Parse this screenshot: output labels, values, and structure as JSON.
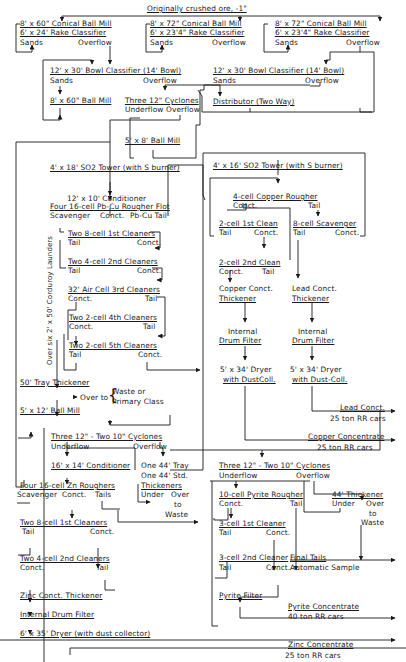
{
  "diagram": {
    "type": "process-flowsheet",
    "feed": "Originally crushed ore, -1\"",
    "nodes": {
      "mill_a": "8' x 60\" Conical Ball Mill",
      "class_a": "6' x 24' Rake Classifier",
      "mill_b": "8' x 72\" Conical Ball Mill",
      "class_b": "6' x 23'4\" Rake Classifier",
      "mill_c": "8' x 72\" Conical Ball Mill",
      "class_c": "6' x 23'4\" Rake Classifier",
      "bowl_1": "12' x 30' Bowl Classifier (14' Bowl)",
      "bowl_2": "12' x 30' Bowl Classifier (14' Bowl)",
      "ball_mill_60": "8' x 60\" Ball Mill",
      "cyclones_3": "Three 12\" Cyclones",
      "distributor": "Distributor (Two Way)",
      "ball_mill_5x8": "5' x 8' Ball Mill",
      "so2_tower_18": "4' x 18' SO2 Tower (with S burner)",
      "conditioner_12": "12' x 10' Conditioner",
      "pbcu_rougher": "Four 16-cell Pb-Cu Rougher Flot",
      "clean1": "Two 8-cell 1st Cleaners",
      "clean2": "Two 4-cell 2nd Cleaners",
      "clean3": "32' Air Cell 3rd Cleaners",
      "clean4": "Two 2-cell 4th Cleaners",
      "clean5": "Two 2-cell 5th Cleaners",
      "launders": "Over six 2' x 50' Corduroy Launders",
      "tray_thickener": "50' Tray Thickener",
      "overflow_to": "Over to",
      "waste_or": "Waste or",
      "primary_class": "Primary Class",
      "ball_mill_5x12": "5' x 12' Ball Mill",
      "so2_tower_16": "4' x 16' SO2 Tower (with S burner)",
      "cu_rougher": "4-cell Copper Rougher",
      "cu_clean1": "2-cell 1st Clean",
      "cu_scav": "8-cell Scavenger",
      "cu_clean2": "2-cell 2nd Clean",
      "cu_thick_1": "Copper Conct.",
      "cu_thick_2": "Thickener",
      "pb_thick_1": "Lead Conct.",
      "pb_thick_2": "Thickener",
      "cu_filter_1": "Internal",
      "cu_filter_2": "Drum Filter",
      "pb_filter_1": "Internal",
      "pb_filter_2": "Drum Filter",
      "cu_dryer_1": "5' x 34' Dryer",
      "cu_dryer_2": "with DustColl.",
      "pb_dryer_1": "5' x 34' Dryer",
      "pb_dryer_2": "with Dust-Coll.",
      "zn_cyclones": "Three 12\" - Two 10\" Cyclones",
      "zn_conditioner": "16' x 14' Conditioner",
      "tray_44_1": "One 44' Tray",
      "tray_44_2": "One 44' Std.",
      "tray_44_3": "Thickeners",
      "zn_rougher": "Four 16-cell Zn Roughers",
      "zn_clean1": "Two 8-cell 1st Cleaners",
      "zn_clean2": "Two 4-cell 2nd Cleaners",
      "zn_thickener": "Zinc Conct. Thickener",
      "zn_filter": "Internal Drum Filter",
      "zn_dryer": "6' x 35' Dryer (with dust collector)",
      "py_cyclones": "Three 12\" - Two 10\" Cyclones",
      "py_rougher": "10-cell Pyrite Rougher",
      "thick_44": "44' Thickener",
      "py_clean1": "3-cell 1st Cleaner",
      "py_clean2": "3-cell 2nd Cleaner",
      "final_tails": "Final Tails",
      "auto_sample": "Automatic Sample",
      "py_filter": "Pyrite Filter"
    },
    "stream_labels": {
      "sands": "Sands",
      "overflow": "Overflow",
      "underflow": "Underflow",
      "scavenger": "Scavenger",
      "conct": "Conct.",
      "tail": "Tail",
      "tails": "Tails",
      "pbcu_tail": "Pb-Cu Tail",
      "under": "Under",
      "over": "Over",
      "to": "to",
      "waste": "Waste"
    },
    "products": {
      "lead": {
        "name": "Lead Conct.",
        "shipping": "25 ton RR cars"
      },
      "copper": {
        "name": "Copper Concentrate",
        "shipping": "25 ton RR cars"
      },
      "pyrite": {
        "name": "Pyrite Concentrate",
        "shipping": "40 ton RR cars"
      },
      "zinc": {
        "name": "Zinc Concentrate",
        "shipping": "25 ton RR cars"
      }
    }
  }
}
